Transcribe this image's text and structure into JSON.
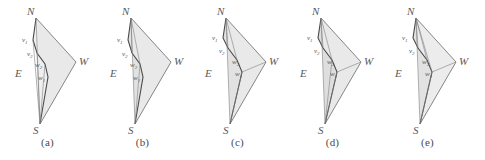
{
  "figure": {
    "kind": "geometry-diagram-series",
    "panel_count": 5,
    "colors": {
      "stroke": "#5a5a5a",
      "shade_fill": "#e9e9e9",
      "shade_fill_dark": "#dedede",
      "label": "#555555",
      "background": "#ffffff"
    },
    "corner_labels": {
      "north": "N",
      "south": "S",
      "east": "E",
      "west": "W"
    },
    "inner_labels": {
      "v1": "v",
      "v1_sub": "1",
      "v2": "v",
      "v2_sub": "2",
      "w2": "w",
      "w2_sub": "2",
      "w1": "w",
      "w1_sub": "1"
    },
    "panels": [
      {
        "id": "panel-a",
        "caption": "(a)",
        "corner_labels": {
          "north": "N",
          "south": "S",
          "east": "E",
          "west": "W"
        },
        "inner_labels": {
          "v1": "v",
          "v1_sub": "1",
          "v2": "v",
          "v2_sub": "2",
          "w2": "w",
          "w2_sub": "2",
          "w1": "w",
          "w1_sub": "1"
        }
      },
      {
        "id": "panel-b",
        "caption": "(b)",
        "corner_labels": {
          "north": "N",
          "south": "S",
          "east": "E",
          "west": "W"
        },
        "inner_labels": {
          "v1": "v",
          "v1_sub": "1",
          "v2": "v",
          "v2_sub": "2",
          "w2": "w",
          "w2_sub": "2",
          "w1": "w",
          "w1_sub": "1"
        }
      },
      {
        "id": "panel-c",
        "caption": "(c)",
        "corner_labels": {
          "north": "N",
          "south": "S",
          "east": "E",
          "west": "W"
        },
        "inner_labels": {
          "v1": "v",
          "v1_sub": "1",
          "v2": "v",
          "v2_sub": "2",
          "w2": "w",
          "w2_sub": "2",
          "w1": "w",
          "w1_sub": "1"
        }
      },
      {
        "id": "panel-d",
        "caption": "(d)",
        "corner_labels": {
          "north": "N",
          "south": "S",
          "east": "E",
          "west": "W"
        },
        "inner_labels": {
          "v1": "v",
          "v1_sub": "1",
          "v2": "v",
          "v2_sub": "2",
          "w2": "w",
          "w2_sub": "2",
          "w1": "w",
          "w1_sub": "1"
        }
      },
      {
        "id": "panel-e",
        "caption": "(e)",
        "corner_labels": {
          "north": "N",
          "south": "S",
          "east": "E",
          "west": "W"
        },
        "inner_labels": {
          "v1": "v",
          "v1_sub": "1",
          "v2": "v",
          "v2_sub": "2",
          "w2": "w",
          "w2_sub": "2",
          "w1": "w",
          "w1_sub": "1"
        }
      }
    ],
    "geometry": {
      "N": [
        36,
        18
      ],
      "S": [
        40,
        124
      ],
      "W": [
        76,
        62
      ],
      "v1": [
        33,
        40
      ],
      "v2": [
        37,
        53
      ],
      "w2": [
        45,
        64
      ],
      "w1": [
        48,
        77
      ],
      "E_label": [
        20,
        74
      ],
      "W_label": [
        79,
        60
      ],
      "N_label": [
        30,
        14
      ],
      "S_label": [
        35,
        132
      ]
    }
  }
}
